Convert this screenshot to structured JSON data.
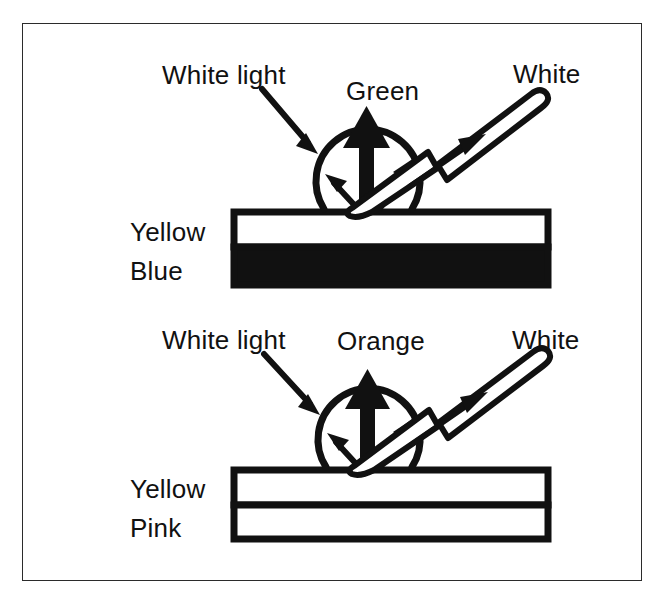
{
  "figure": {
    "background_color": "#ffffff",
    "ink_color": "#111111",
    "frame_color": "#2b2b2b"
  },
  "panels": [
    {
      "id": "top-panel",
      "incoming_label": "White light",
      "scatter_label": "Green",
      "reflection_label": "White",
      "layers": [
        {
          "name": "Yellow",
          "fill": "white"
        },
        {
          "name": "Blue",
          "fill": "black"
        }
      ]
    },
    {
      "id": "bottom-panel",
      "incoming_label": "White light",
      "scatter_label": "Orange",
      "reflection_label": "White",
      "layers": [
        {
          "name": "Yellow",
          "fill": "white"
        },
        {
          "name": "Pink",
          "fill": "white"
        }
      ]
    }
  ],
  "icons": {
    "droplet": "droplet-circle-icon",
    "incoming_arrow": "incoming-light-arrow-icon",
    "up_arrow": "scattered-light-up-arrow-icon",
    "small_arrow_left": "internal-scatter-left-arrow-icon",
    "small_arrow_right": "internal-scatter-right-arrow-icon",
    "hollow_arrow": "specular-reflection-hollow-arrow-icon",
    "inner_arrow": "specular-reflection-inner-arrow-icon"
  }
}
